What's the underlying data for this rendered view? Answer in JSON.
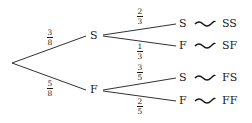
{
  "diagram": {
    "type": "probability-tree",
    "first_stage": [
      {
        "outcome": "S",
        "probability": {
          "num": "3",
          "den": "8"
        }
      },
      {
        "outcome": "F",
        "probability": {
          "num": "5",
          "den": "8"
        }
      }
    ],
    "second_stage": [
      {
        "parent": "S",
        "outcome": "S",
        "probability": {
          "num": "2",
          "den": "3"
        },
        "result": "SS"
      },
      {
        "parent": "S",
        "outcome": "F",
        "probability": {
          "num": "1",
          "den": "3"
        },
        "result": "SF"
      },
      {
        "parent": "F",
        "outcome": "S",
        "probability": {
          "num": "3",
          "den": "5"
        },
        "result": "FS"
      },
      {
        "parent": "F",
        "outcome": "F",
        "probability": {
          "num": "2",
          "den": "5"
        },
        "result": "FF"
      }
    ],
    "colors": {
      "ink": "#1a1a1a",
      "background": "#ffffff"
    }
  }
}
